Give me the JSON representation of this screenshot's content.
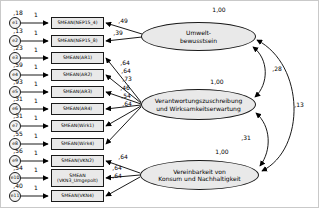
{
  "diagram": {
    "latents": [
      {
        "line1": "Umwelt-",
        "line2": "bewusstsein",
        "variance": "1,00"
      },
      {
        "line1": "Verantwortungszuschreibung",
        "line2": "und Wirksamkeitserwartung",
        "variance": "1,00"
      },
      {
        "line1": "Vereinbarkeit von",
        "line2": "Konsum und Nachhaltigkeit",
        "variance": "1,00"
      }
    ],
    "covariances": [
      {
        "between": "Umweltbewusstsein <-> Verantwortungszuschreibung und Wirksamkeitserwartung",
        "value": ",28"
      },
      {
        "between": "Verantwortungszuschreibung und Wirksamkeitserwartung <-> Vereinbarkeit von Konsum und Nachhaltigkeit",
        "value": ",31"
      },
      {
        "between": "Umweltbewusstsein <-> Vereinbarkeit von Konsum und Nachhaltigkeit",
        "value": ",13"
      }
    ],
    "indicators": [
      {
        "error": "e1",
        "error_variance": ",18",
        "weight": "1",
        "label": "SMEAN(NEP15_4)",
        "label2": "",
        "loading": ",49"
      },
      {
        "error": "e2",
        "error_variance": ",13",
        "weight": "1",
        "label": "SMEAN(NEP15_8)",
        "label2": "",
        "loading": ",39"
      },
      {
        "error": "e3",
        "error_variance": ",23",
        "weight": "1",
        "label": "SMEAN(AR1)",
        "label2": "",
        "loading": ",64"
      },
      {
        "error": "e4",
        "error_variance": ",59",
        "weight": "1",
        "label": "SMEAN(AR2)",
        "label2": "",
        "loading": ",64"
      },
      {
        "error": "e5",
        "error_variance": ",93",
        "weight": "1",
        "label": "SMEAN(AR3)",
        "label2": "",
        "loading": ",73"
      },
      {
        "error": "e6",
        "error_variance": ",31",
        "weight": "1",
        "label": "SMEAN(AR4)",
        "label2": "",
        "loading": ",46"
      },
      {
        "error": "e7",
        "error_variance": ",31",
        "weight": "1",
        "label": "SMEAN(Wirk1)",
        "label2": "",
        "loading": ",54"
      },
      {
        "error": "e8",
        "error_variance": ",55",
        "weight": "1",
        "label": "SMEAN(Wirk4)",
        "label2": "",
        "loading": ",64"
      },
      {
        "error": "e9",
        "error_variance": ",56",
        "weight": "1",
        "label": "SMEAN(VKN2)",
        "label2": "",
        "loading": ",64"
      },
      {
        "error": "e10",
        "error_variance": ",54",
        "weight": "1",
        "label": "SMEAN",
        "label2": "(VKN3_Umgepolt)",
        "loading": ",64"
      },
      {
        "error": "e11",
        "error_variance": ",40",
        "weight": "1",
        "label": "SMEAN(VKN4)",
        "label2": "",
        "loading": ",64"
      }
    ]
  }
}
